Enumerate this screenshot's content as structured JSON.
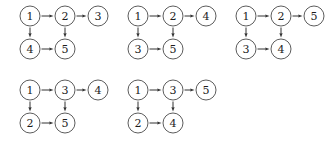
{
  "figure": {
    "background_color": "#ffffff",
    "node_stroke_color": "#4a4a4a",
    "node_fill_color": "#ffffff",
    "edge_color": "#333333",
    "label_color": "#1c1c1c",
    "node_radius": 10
  },
  "diagrams": [
    {
      "name": "diagram-1",
      "origin": {
        "x": 20,
        "y": 6
      },
      "nodes": [
        {
          "id": "a",
          "label": "1",
          "cx": 30,
          "cy": 16
        },
        {
          "id": "b",
          "label": "2",
          "cx": 65,
          "cy": 16
        },
        {
          "id": "c",
          "label": "3",
          "cx": 98,
          "cy": 16
        },
        {
          "id": "d",
          "label": "4",
          "cx": 30,
          "cy": 49
        },
        {
          "id": "e",
          "label": "5",
          "cx": 65,
          "cy": 49
        }
      ],
      "edges": [
        {
          "from": "a",
          "to": "b"
        },
        {
          "from": "b",
          "to": "c"
        },
        {
          "from": "a",
          "to": "d"
        },
        {
          "from": "b",
          "to": "e"
        },
        {
          "from": "d",
          "to": "e"
        }
      ]
    },
    {
      "name": "diagram-2",
      "origin": {
        "x": 128,
        "y": 6
      },
      "nodes": [
        {
          "id": "a",
          "label": "1",
          "cx": 138,
          "cy": 16
        },
        {
          "id": "b",
          "label": "2",
          "cx": 173,
          "cy": 16
        },
        {
          "id": "c",
          "label": "4",
          "cx": 206,
          "cy": 16
        },
        {
          "id": "d",
          "label": "3",
          "cx": 138,
          "cy": 49
        },
        {
          "id": "e",
          "label": "5",
          "cx": 173,
          "cy": 49
        }
      ],
      "edges": [
        {
          "from": "a",
          "to": "b"
        },
        {
          "from": "b",
          "to": "c"
        },
        {
          "from": "a",
          "to": "d"
        },
        {
          "from": "b",
          "to": "e"
        },
        {
          "from": "d",
          "to": "e"
        }
      ]
    },
    {
      "name": "diagram-3",
      "origin": {
        "x": 236,
        "y": 6
      },
      "nodes": [
        {
          "id": "a",
          "label": "1",
          "cx": 246,
          "cy": 16
        },
        {
          "id": "b",
          "label": "2",
          "cx": 281,
          "cy": 16
        },
        {
          "id": "c",
          "label": "5",
          "cx": 314,
          "cy": 16
        },
        {
          "id": "d",
          "label": "3",
          "cx": 246,
          "cy": 49
        },
        {
          "id": "e",
          "label": "4",
          "cx": 281,
          "cy": 49
        }
      ],
      "edges": [
        {
          "from": "a",
          "to": "b"
        },
        {
          "from": "b",
          "to": "c"
        },
        {
          "from": "a",
          "to": "d"
        },
        {
          "from": "b",
          "to": "e"
        },
        {
          "from": "d",
          "to": "e"
        }
      ]
    },
    {
      "name": "diagram-4",
      "origin": {
        "x": 20,
        "y": 80
      },
      "nodes": [
        {
          "id": "a",
          "label": "1",
          "cx": 30,
          "cy": 90
        },
        {
          "id": "b",
          "label": "3",
          "cx": 65,
          "cy": 90
        },
        {
          "id": "c",
          "label": "4",
          "cx": 98,
          "cy": 90
        },
        {
          "id": "d",
          "label": "2",
          "cx": 30,
          "cy": 123
        },
        {
          "id": "e",
          "label": "5",
          "cx": 65,
          "cy": 123
        }
      ],
      "edges": [
        {
          "from": "a",
          "to": "b"
        },
        {
          "from": "b",
          "to": "c"
        },
        {
          "from": "a",
          "to": "d"
        },
        {
          "from": "b",
          "to": "e"
        },
        {
          "from": "d",
          "to": "e"
        }
      ]
    },
    {
      "name": "diagram-5",
      "origin": {
        "x": 128,
        "y": 80
      },
      "nodes": [
        {
          "id": "a",
          "label": "1",
          "cx": 138,
          "cy": 90
        },
        {
          "id": "b",
          "label": "3",
          "cx": 173,
          "cy": 90
        },
        {
          "id": "c",
          "label": "5",
          "cx": 206,
          "cy": 90
        },
        {
          "id": "d",
          "label": "2",
          "cx": 138,
          "cy": 123
        },
        {
          "id": "e",
          "label": "4",
          "cx": 173,
          "cy": 123
        }
      ],
      "edges": [
        {
          "from": "a",
          "to": "b"
        },
        {
          "from": "b",
          "to": "c"
        },
        {
          "from": "a",
          "to": "d"
        },
        {
          "from": "b",
          "to": "e"
        },
        {
          "from": "d",
          "to": "e"
        }
      ]
    }
  ]
}
